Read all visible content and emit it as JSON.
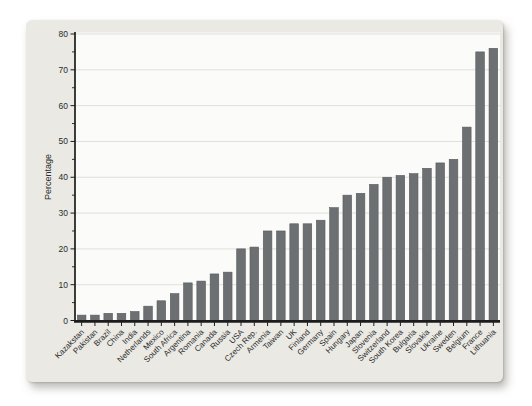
{
  "chart_data": {
    "type": "bar",
    "title": "",
    "xlabel": "",
    "ylabel": "Percentage",
    "ylim": [
      0,
      80
    ],
    "ytick_step": 10,
    "ytick_minor_step": 5,
    "grid": "horizontal-major",
    "legend": "none",
    "bar_label_rotation_deg": 45,
    "categories": [
      "Kazakstan",
      "Pakistan",
      "Brazil",
      "China",
      "India",
      "Netherlands",
      "Mexico",
      "South Africa",
      "Argentina",
      "Romania",
      "Canada",
      "Russia",
      "USA",
      "Czech Rep.",
      "Armenia",
      "Taiwan",
      "UK",
      "Finland",
      "Germany",
      "Spain",
      "Hungary",
      "Japan",
      "Slovenia",
      "Switzerland",
      "South Korea",
      "Bulgaria",
      "Slovakia",
      "Ukraine",
      "Sweden",
      "Belgium",
      "France",
      "Lithuania"
    ],
    "values": [
      1.5,
      1.5,
      2,
      2,
      2.5,
      4,
      5.5,
      7.5,
      10.5,
      11,
      13,
      13.5,
      20,
      20.5,
      25,
      25,
      27,
      27,
      28,
      31.5,
      35,
      35.5,
      38,
      40,
      40.5,
      41,
      42.5,
      44,
      45,
      54,
      75,
      76
    ],
    "colors": {
      "bar": "#6c7073",
      "bar_edge": "#57595b",
      "panel_bg": "#eae9e4",
      "plot_bg": "#fbfbf9",
      "gridline": "#e0dfda",
      "axis": "#1c1c1c",
      "text": "#2b2b2b"
    }
  }
}
